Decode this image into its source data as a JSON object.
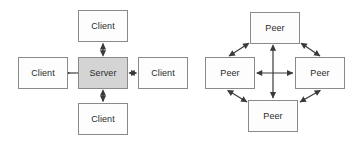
{
  "diagram": {
    "background_color": "#ffffff",
    "stroke_color": "#555555",
    "box_border_color": "#8a8a8a",
    "box_fill_white": "#fdfdfd",
    "box_fill_gray": "#d4d4d4",
    "label_color": "#2b2b2b"
  },
  "client_server": {
    "name": "client-server-topology",
    "center_node": {
      "label": "Server",
      "fill": "#d4d4d4"
    },
    "nodes": [
      {
        "id": "client-top",
        "label": "Client",
        "position": "top",
        "fill": "#fdfdfd"
      },
      {
        "id": "client-left",
        "label": "Client",
        "position": "left",
        "fill": "#fdfdfd"
      },
      {
        "id": "client-right",
        "label": "Client",
        "position": "right",
        "fill": "#fdfdfd"
      },
      {
        "id": "client-bottom",
        "label": "Client",
        "position": "bottom",
        "fill": "#fdfdfd"
      }
    ],
    "connections": [
      {
        "from": "Server",
        "to": "Client",
        "direction": "bidirectional",
        "orientation": "vertical-up"
      },
      {
        "from": "Server",
        "to": "Client",
        "direction": "bidirectional",
        "orientation": "horizontal-left"
      },
      {
        "from": "Server",
        "to": "Client",
        "direction": "bidirectional",
        "orientation": "horizontal-right"
      },
      {
        "from": "Server",
        "to": "Client",
        "direction": "bidirectional",
        "orientation": "vertical-down"
      }
    ]
  },
  "peer_to_peer": {
    "name": "peer-to-peer-topology",
    "nodes": [
      {
        "id": "peer-top",
        "label": "Peer",
        "position": "top",
        "fill": "#fdfdfd"
      },
      {
        "id": "peer-left",
        "label": "Peer",
        "position": "left",
        "fill": "#fdfdfd"
      },
      {
        "id": "peer-right",
        "label": "Peer",
        "position": "right",
        "fill": "#fdfdfd"
      },
      {
        "id": "peer-bottom",
        "label": "Peer",
        "position": "bottom",
        "fill": "#fdfdfd"
      }
    ],
    "connections": [
      {
        "from": "Peer",
        "to": "Peer",
        "direction": "bidirectional",
        "orientation": "diagonal-top-left"
      },
      {
        "from": "Peer",
        "to": "Peer",
        "direction": "bidirectional",
        "orientation": "diagonal-top-right"
      },
      {
        "from": "Peer",
        "to": "Peer",
        "direction": "bidirectional",
        "orientation": "diagonal-bottom-left"
      },
      {
        "from": "Peer",
        "to": "Peer",
        "direction": "bidirectional",
        "orientation": "diagonal-bottom-right"
      },
      {
        "from": "Peer",
        "to": "Peer",
        "direction": "bidirectional",
        "orientation": "vertical-center"
      },
      {
        "from": "Peer",
        "to": "Peer",
        "direction": "bidirectional",
        "orientation": "horizontal-center"
      }
    ]
  }
}
